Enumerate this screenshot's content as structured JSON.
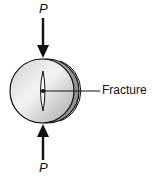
{
  "figure": {
    "labels": {
      "load_top": "P",
      "load_bottom": "P",
      "fracture": "Fracture"
    },
    "colors": {
      "stroke": "#111111",
      "disk_light": "#f2f2f2",
      "disk_mid": "#c8c8c8",
      "disk_dark": "#9a9a9a",
      "background": "#ffffff"
    }
  }
}
